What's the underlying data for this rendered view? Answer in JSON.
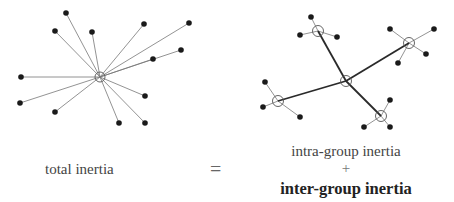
{
  "labels": {
    "total": "total inertia",
    "equals": "=",
    "intra": "intra-group inertia",
    "plus": "+",
    "inter": "inter-group inertia"
  },
  "left_diagram": {
    "center": [
      100,
      77
    ],
    "points": [
      [
        66,
        13
      ],
      [
        55,
        31
      ],
      [
        92,
        32
      ],
      [
        144,
        24
      ],
      [
        189,
        23
      ],
      [
        181,
        50
      ],
      [
        153,
        59
      ],
      [
        21,
        77
      ],
      [
        20,
        103
      ],
      [
        55,
        112
      ],
      [
        145,
        96
      ],
      [
        119,
        123
      ],
      [
        145,
        123
      ]
    ]
  },
  "right_diagram": {
    "center": [
      346,
      81
    ],
    "groups": [
      {
        "center": [
          318,
          31
        ],
        "points": [
          [
            311,
            17
          ],
          [
            300,
            35
          ],
          [
            337,
            37
          ]
        ]
      },
      {
        "center": [
          409,
          43
        ],
        "points": [
          [
            390,
            29
          ],
          [
            434,
            29
          ],
          [
            426,
            54
          ],
          [
            398,
            63
          ]
        ]
      },
      {
        "center": [
          278,
          101
        ],
        "points": [
          [
            265,
            82
          ],
          [
            263,
            107
          ],
          [
            300,
            117
          ]
        ]
      },
      {
        "center": [
          381,
          116
        ],
        "points": [
          [
            390,
            100
          ],
          [
            364,
            127
          ],
          [
            390,
            127
          ]
        ]
      }
    ]
  },
  "colors": {
    "point": "#1a1a1a",
    "thin_line": "#777777",
    "thick_line": "#2a2a2a",
    "centroid_circle": "#555555"
  }
}
